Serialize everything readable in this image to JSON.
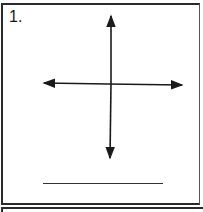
{
  "worksheet": {
    "problem_number": "1.",
    "figure": {
      "type": "coordinate-axes",
      "description": "horizontal and vertical double-headed arrows crossing at center"
    },
    "answer_line": ""
  }
}
